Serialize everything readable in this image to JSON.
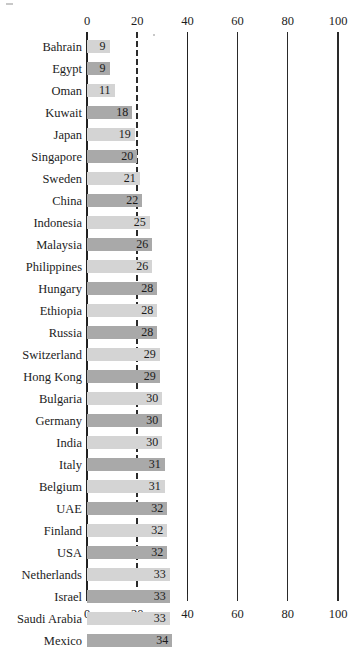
{
  "chart_data": {
    "type": "bar",
    "orientation": "horizontal",
    "title": "",
    "subtitle": "",
    "xlabel": "",
    "ylabel": "",
    "xlim": [
      0,
      100
    ],
    "xticks": [
      0,
      20,
      40,
      60,
      80,
      100
    ],
    "xtick_labels": [
      "0",
      "20",
      "40",
      "60",
      "80",
      "100"
    ],
    "grid": true,
    "gridline_values": [
      0,
      20,
      40,
      60,
      80,
      100
    ],
    "reference_line": 20,
    "legend": "none",
    "axis_top": true,
    "axis_bottom": true,
    "categories": [
      "Bahrain",
      "Egypt",
      "Oman",
      "Kuwait",
      "Japan",
      "Singapore",
      "Sweden",
      "China",
      "Indonesia",
      "Malaysia",
      "Philippines",
      "Hungary",
      "Ethiopia",
      "Russia",
      "Switzerland",
      "Hong Kong",
      "Bulgaria",
      "Germany",
      "India",
      "Italy",
      "Belgium",
      "UAE",
      "Finland",
      "USA",
      "Netherlands",
      "Israel",
      "Saudi Arabia",
      "Mexico"
    ],
    "values": [
      9,
      9,
      11,
      18,
      19,
      20,
      21,
      22,
      25,
      26,
      26,
      28,
      28,
      28,
      29,
      29,
      30,
      30,
      30,
      31,
      31,
      32,
      32,
      32,
      33,
      33,
      33,
      34
    ],
    "bar_shades": [
      "light",
      "dark",
      "light",
      "dark",
      "light",
      "dark",
      "light",
      "dark",
      "light",
      "dark",
      "light",
      "dark",
      "light",
      "dark",
      "light",
      "dark",
      "light",
      "dark",
      "light",
      "dark",
      "light",
      "dark",
      "light",
      "dark",
      "light",
      "dark",
      "light",
      "dark"
    ],
    "colors": {
      "bar_light": "#d4d4d4",
      "bar_dark": "#a9a9a9",
      "axis": "#2a2a2a",
      "text": "#1c1c1c",
      "background": "#ffffff"
    }
  }
}
